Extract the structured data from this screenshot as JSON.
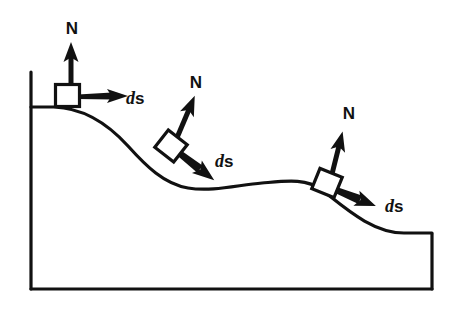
{
  "figure": {
    "kind": "physics-free-body-diagram",
    "colors": {
      "stroke": "#111111",
      "background": "#ffffff",
      "block_fill": "#ffffff"
    },
    "surface": {
      "description": "Curved descending hill profile with left vertical wall, flat base and right vertical wall",
      "left_wall_x": 30,
      "base_y": 289,
      "right_wall_x": 432,
      "curve_start": [
        30,
        107
      ],
      "curve_end": [
        432,
        234
      ],
      "path": "M 30 107 L 52 107 C 90 108 112 128 140 160 C 160 182 176 193 205 190 C 228 188 248 185 272 184 C 300 183 318 178 338 196 C 360 216 384 234 410 233 L 432 234"
    },
    "blocks": [
      {
        "id": "block-1",
        "label_normal": "N",
        "label_displacement_italic": "d",
        "label_displacement_bold": "s",
        "angle_deg": 0,
        "center": [
          68,
          96
        ],
        "normal_label_pos": [
          72,
          34
        ],
        "displacement_label_pos": [
          132,
          104
        ]
      },
      {
        "id": "block-2",
        "label_normal": "N",
        "label_displacement_italic": "d",
        "label_displacement_bold": "s",
        "angle_deg": 38,
        "center": [
          172,
          147
        ],
        "normal_label_pos": [
          196,
          88
        ],
        "displacement_label_pos": [
          219,
          167
        ]
      },
      {
        "id": "block-3",
        "label_normal": "N",
        "label_displacement_italic": "d",
        "label_displacement_bold": "s",
        "angle_deg": 22,
        "center": [
          327,
          184
        ],
        "normal_label_pos": [
          349,
          119
        ],
        "displacement_label_pos": [
          389,
          212
        ]
      }
    ]
  }
}
